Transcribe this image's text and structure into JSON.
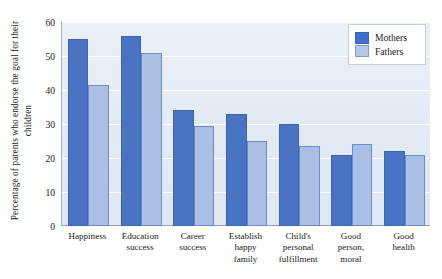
{
  "chart_data": {
    "type": "bar",
    "title": "",
    "xlabel": "",
    "ylabel": "Percentage of parents who endorse the goal for their children",
    "ylim": [
      0,
      60
    ],
    "yticks": [
      0,
      10,
      20,
      30,
      40,
      50,
      60
    ],
    "grid": true,
    "legend_position": "top-right",
    "categories": [
      "Happiness",
      "Education success",
      "Career success",
      "Establish happy family",
      "Child's personal fulfillment",
      "Good person, moral",
      "Good health"
    ],
    "category_lines": [
      [
        "Happiness"
      ],
      [
        "Education",
        "success"
      ],
      [
        "Career",
        "success"
      ],
      [
        "Establish",
        "happy",
        "family"
      ],
      [
        "Child's",
        "personal",
        "fulfillment"
      ],
      [
        "Good",
        "person,",
        "moral"
      ],
      [
        "Good",
        "health"
      ]
    ],
    "series": [
      {
        "name": "Mothers",
        "color": "#4a74c3",
        "values": [
          55,
          56,
          34,
          33,
          30,
          21,
          22
        ]
      },
      {
        "name": "Fathers",
        "color": "#aabfe3",
        "values": [
          41.5,
          51,
          29.5,
          25,
          23.5,
          24,
          21
        ]
      }
    ]
  },
  "legend": {
    "items": [
      {
        "label": "Mothers"
      },
      {
        "label": "Fathers"
      }
    ]
  }
}
